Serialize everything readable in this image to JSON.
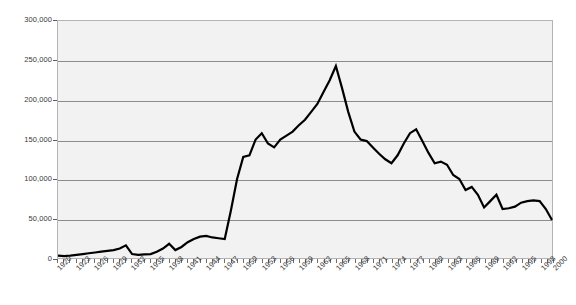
{
  "chart_data": {
    "type": "line",
    "title": "",
    "subtitle": "",
    "xlabel": "",
    "ylabel": "",
    "xlim": [
      1920,
      2000
    ],
    "ylim": [
      0,
      300000
    ],
    "grid": true,
    "legend": "none",
    "y_ticks": [
      0,
      50000,
      100000,
      150000,
      200000,
      250000,
      300000
    ],
    "y_tick_labels": [
      "0",
      "50,000",
      "100,000",
      "150,000",
      "200,000",
      "250,000",
      "300,000"
    ],
    "x_tick_labels": [
      "1920",
      "1923",
      "1926",
      "1929",
      "1932",
      "1935",
      "1938",
      "1941",
      "1944",
      "1947",
      "1950",
      "1953",
      "1956",
      "1959",
      "1962",
      "1965",
      "1968",
      "1971",
      "1974",
      "1977",
      "1980",
      "1983",
      "1986",
      "1989",
      "1992",
      "1995",
      "1998",
      "2000"
    ],
    "x": [
      1920,
      1921,
      1922,
      1923,
      1924,
      1925,
      1926,
      1927,
      1928,
      1929,
      1930,
      1931,
      1932,
      1933,
      1934,
      1935,
      1936,
      1937,
      1938,
      1939,
      1940,
      1941,
      1942,
      1943,
      1944,
      1945,
      1946,
      1947,
      1948,
      1949,
      1950,
      1951,
      1952,
      1953,
      1954,
      1955,
      1956,
      1957,
      1958,
      1959,
      1960,
      1961,
      1962,
      1963,
      1964,
      1965,
      1966,
      1967,
      1968,
      1969,
      1970,
      1971,
      1972,
      1973,
      1974,
      1975,
      1976,
      1977,
      1978,
      1979,
      1980,
      1981,
      1982,
      1983,
      1984,
      1985,
      1986,
      1987,
      1988,
      1989,
      1990,
      1991,
      1992,
      1993,
      1994,
      1995,
      1996,
      1997,
      1998,
      1999,
      2000
    ],
    "values": [
      3000,
      2500,
      3000,
      4000,
      5000,
      6000,
      7000,
      8000,
      9000,
      10000,
      12000,
      16000,
      5000,
      4000,
      4500,
      5000,
      8000,
      12000,
      18000,
      10000,
      14000,
      20000,
      24000,
      27000,
      28000,
      26000,
      25000,
      24000,
      60000,
      100000,
      128000,
      130000,
      150000,
      158000,
      145000,
      140000,
      150000,
      155000,
      160000,
      168000,
      175000,
      185000,
      195000,
      210000,
      225000,
      243000,
      215000,
      185000,
      160000,
      150000,
      148000,
      140000,
      132000,
      125000,
      120000,
      130000,
      145000,
      158000,
      163000,
      148000,
      133000,
      120000,
      122000,
      118000,
      105000,
      100000,
      86000,
      90000,
      80000,
      64000,
      72000,
      80000,
      62000,
      63000,
      65000,
      70000,
      72000,
      73000,
      72000,
      62000,
      48000
    ]
  },
  "axis": {
    "y_unit_note": "",
    "x_unit_note": ""
  }
}
